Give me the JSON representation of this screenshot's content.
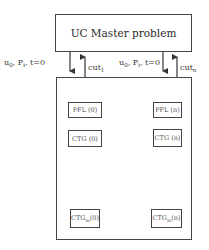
{
  "master": {
    "title": "UC Master problem"
  },
  "links": [
    {
      "down_label_main": "u",
      "down_label_sub": "0",
      "down_label_rest": ", P",
      "down_label_sub2": "i",
      "down_label_tail": ", t=0",
      "up_label_main": "cut",
      "up_label_sub": "1"
    },
    {
      "down_label_main": "u",
      "down_label_sub": "0",
      "down_label_rest": ", P",
      "down_label_sub2": "i",
      "down_label_tail": ", t=0",
      "up_label_main": "cut",
      "up_label_sub": "n"
    }
  ],
  "subproblems": {
    "pfl_0": "PFL (0)",
    "pfl_n": "PFL (n)",
    "ctg_0": "CTG (0)",
    "ctg_n": "CTG (n)",
    "ctgm_0": {
      "main": "CTG",
      "sub": "m",
      "tail": "(0)"
    },
    "ctgm_n": {
      "main": "CTG",
      "sub": "m",
      "tail": "(n)"
    }
  },
  "colors": {
    "line": "#444444",
    "text": "#333333",
    "background": "#ffffff"
  }
}
